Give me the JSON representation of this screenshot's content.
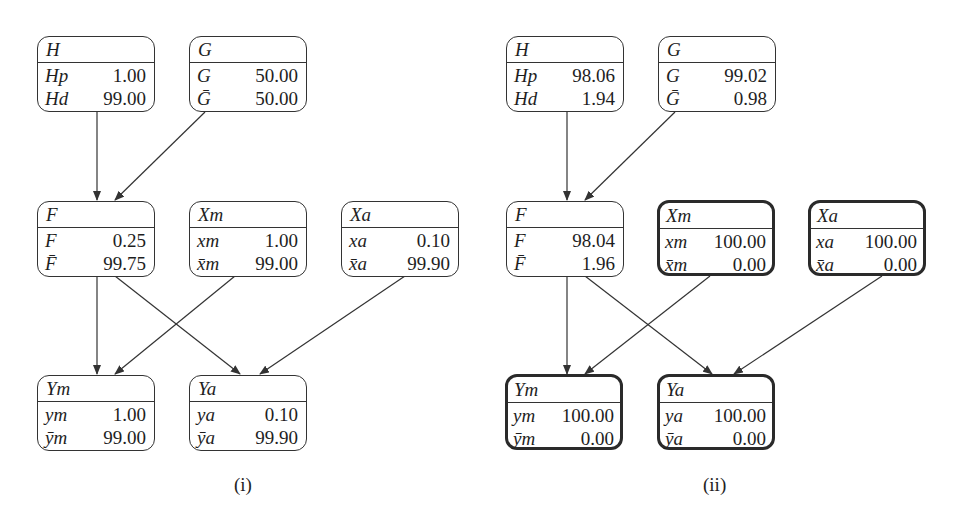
{
  "panels": [
    {
      "caption": "(i)",
      "nodes": {
        "H": {
          "title": "H",
          "rows": [
            {
              "label": "Hp",
              "value": "1.00"
            },
            {
              "label": "Hd",
              "value": "99.00"
            }
          ]
        },
        "G": {
          "title": "G",
          "rows": [
            {
              "label": "G",
              "value": "50.00"
            },
            {
              "label": "Ḡ",
              "value": "50.00"
            }
          ]
        },
        "F": {
          "title": "F",
          "rows": [
            {
              "label": "F",
              "value": "0.25"
            },
            {
              "label": "F̄",
              "value": "99.75"
            }
          ]
        },
        "Xm": {
          "title": "Xm",
          "rows": [
            {
              "label": "xm",
              "value": "1.00"
            },
            {
              "label": "x̄m",
              "value": "99.00"
            }
          ]
        },
        "Xa": {
          "title": "Xa",
          "rows": [
            {
              "label": "xa",
              "value": "0.10"
            },
            {
              "label": "x̄a",
              "value": "99.90"
            }
          ]
        },
        "Ym": {
          "title": "Ym",
          "rows": [
            {
              "label": "ym",
              "value": "1.00"
            },
            {
              "label": "ȳm",
              "value": "99.00"
            }
          ]
        },
        "Ya": {
          "title": "Ya",
          "rows": [
            {
              "label": "ya",
              "value": "0.10"
            },
            {
              "label": "ȳa",
              "value": "99.90"
            }
          ]
        }
      }
    },
    {
      "caption": "(ii)",
      "nodes": {
        "H": {
          "title": "H",
          "rows": [
            {
              "label": "Hp",
              "value": "98.06"
            },
            {
              "label": "Hd",
              "value": "1.94"
            }
          ]
        },
        "G": {
          "title": "G",
          "rows": [
            {
              "label": "G",
              "value": "99.02"
            },
            {
              "label": "Ḡ",
              "value": "0.98"
            }
          ]
        },
        "F": {
          "title": "F",
          "rows": [
            {
              "label": "F",
              "value": "98.04"
            },
            {
              "label": "F̄",
              "value": "1.96"
            }
          ]
        },
        "Xm": {
          "title": "Xm",
          "rows": [
            {
              "label": "xm",
              "value": "100.00"
            },
            {
              "label": "x̄m",
              "value": "0.00"
            }
          ]
        },
        "Xa": {
          "title": "Xa",
          "rows": [
            {
              "label": "xa",
              "value": "100.00"
            },
            {
              "label": "x̄a",
              "value": "0.00"
            }
          ]
        },
        "Ym": {
          "title": "Ym",
          "rows": [
            {
              "label": "ym",
              "value": "100.00"
            },
            {
              "label": "ȳm",
              "value": "0.00"
            }
          ]
        },
        "Ya": {
          "title": "Ya",
          "rows": [
            {
              "label": "ya",
              "value": "100.00"
            },
            {
              "label": "ȳa",
              "value": "0.00"
            }
          ]
        }
      },
      "evidence_nodes": [
        "Xm",
        "Xa",
        "Ym",
        "Ya"
      ]
    }
  ],
  "edges": [
    [
      "H",
      "F"
    ],
    [
      "G",
      "F"
    ],
    [
      "F",
      "Ym"
    ],
    [
      "F",
      "Ya"
    ],
    [
      "Xm",
      "Ym"
    ],
    [
      "Xa",
      "Ya"
    ]
  ],
  "colors": {
    "line": "#333333",
    "text": "#1e1e1e",
    "background": "#ffffff"
  }
}
